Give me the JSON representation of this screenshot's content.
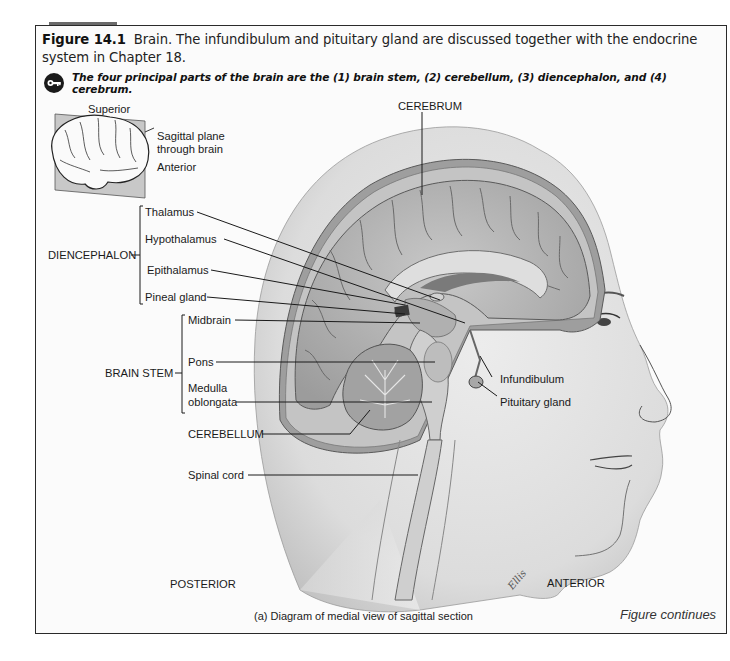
{
  "figure": {
    "number": "Figure 14.1",
    "caption": "Brain. The infundibulum and pituitary gland are discussed together with the endocrine system in Chapter 18.",
    "key_concept": "The four principal parts of the brain are the (1) brain stem, (2) cerebellum, (3) diencephalon, and (4) cerebrum.",
    "subcaption": "(a) Diagram of medial view of sagittal section",
    "continues": "Figure continues"
  },
  "inset": {
    "superior": "Superior",
    "plane_line1": "Sagittal plane",
    "plane_line2": "through brain",
    "anterior": "Anterior"
  },
  "labels": {
    "cerebrum": "CEREBRUM",
    "diencephalon": "DIENCEPHALON",
    "thalamus": "Thalamus",
    "hypothalamus": "Hypothalamus",
    "epithalamus": "Epithalamus",
    "pineal_gland": "Pineal gland",
    "brain_stem": "BRAIN STEM",
    "midbrain": "Midbrain",
    "pons": "Pons",
    "medulla_line1": "Medulla",
    "medulla_line2": "oblongata",
    "cerebellum": "CEREBELLUM",
    "spinal_cord": "Spinal cord",
    "infundibulum": "Infundibulum",
    "pituitary_gland": "Pituitary gland",
    "posterior": "POSTERIOR",
    "anterior": "ANTERIOR",
    "signature": "Ellis"
  },
  "colors": {
    "frame": "#2a2a2a",
    "tab": "#6a6a6a",
    "skin": "#d9d9d9",
    "brain": "#b5b5b5",
    "brain_dark": "#8a8a8a"
  }
}
